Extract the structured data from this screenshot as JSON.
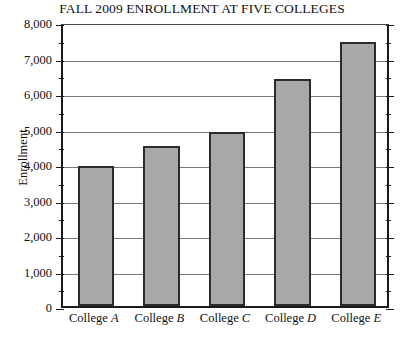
{
  "chart_data": {
    "type": "bar",
    "title": "FALL 2009 ENROLLMENT AT FIVE COLLEGES",
    "xlabel": "",
    "ylabel": "Enrollment",
    "categories": [
      "College A",
      "College B",
      "College C",
      "College D",
      "College E"
    ],
    "category_prefix": "College",
    "category_letters": [
      "A",
      "B",
      "C",
      "D",
      "E"
    ],
    "values": [
      3950,
      4500,
      4900,
      6400,
      7450
    ],
    "ylim": [
      0,
      8000
    ],
    "y_major_step": 1000,
    "y_minor_step": 500,
    "y_tick_labels": [
      "8,000",
      "7,000",
      "6,000",
      "5,000",
      "4,000",
      "3,000",
      "2,000",
      "1,000",
      "0"
    ],
    "y_tick_values": [
      8000,
      7000,
      6000,
      5000,
      4000,
      3000,
      2000,
      1000,
      0
    ],
    "grid": true,
    "legend": "none",
    "bar_fill_color": "#a8a8a8",
    "bar_edge_color": "#2b2b2b",
    "gridline_color": "#777777",
    "axis_color": "#1a1a1a",
    "background_color": "#ffffff"
  }
}
